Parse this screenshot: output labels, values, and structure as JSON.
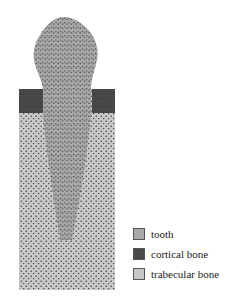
{
  "diagram": {
    "regions": [
      {
        "name": "tooth",
        "color": "#a9a9a9"
      },
      {
        "name": "cortical bone",
        "color": "#4a4a4a"
      },
      {
        "name": "trabecular bone",
        "color": "#c8c8c8"
      }
    ]
  },
  "legend": {
    "items": [
      {
        "label": "tooth",
        "color": "#a9a9a9"
      },
      {
        "label": "cortical bone",
        "color": "#4a4a4a"
      },
      {
        "label": "trabecular bone",
        "color": "#c8c8c8"
      }
    ]
  }
}
